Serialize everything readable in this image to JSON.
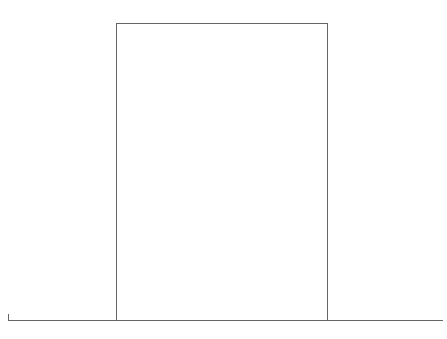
{
  "top": {
    "numbers": [
      "1",
      "2",
      "3",
      "4",
      "5",
      "6",
      "7",
      "8",
      "9",
      "10",
      "11",
      "12",
      "13",
      "14",
      "15",
      "16",
      "17",
      "18",
      "19",
      "20"
    ]
  },
  "left": {
    "numbers": [
      "21",
      "22",
      "23",
      "24",
      "25",
      "26",
      "27",
      "28",
      "29",
      "30",
      "31",
      "32",
      "33",
      "34",
      "35",
      "36",
      "37",
      "38",
      "39",
      "40"
    ]
  },
  "right": {
    "numbers": [
      "41",
      "42",
      "43",
      "44",
      "45",
      "46",
      "47",
      "48",
      "49",
      "50",
      "51",
      "52",
      "53",
      "54",
      "55",
      "56",
      "57",
      "58",
      "59",
      "60"
    ]
  },
  "bottom": {
    "numbers": [
      "61",
      "62",
      "63",
      "64",
      "65",
      "66",
      "67",
      "68",
      "69",
      "70",
      "71",
      "72",
      "73",
      "74",
      "75",
      "76",
      "77",
      "78",
      "79",
      "80",
      "81",
      "82",
      "83",
      "84",
      "85",
      "86",
      "87",
      "88",
      "89",
      "90",
      "91",
      "92",
      "93",
      "94",
      "95",
      "96",
      "97",
      "98",
      "99",
      "100"
    ]
  }
}
